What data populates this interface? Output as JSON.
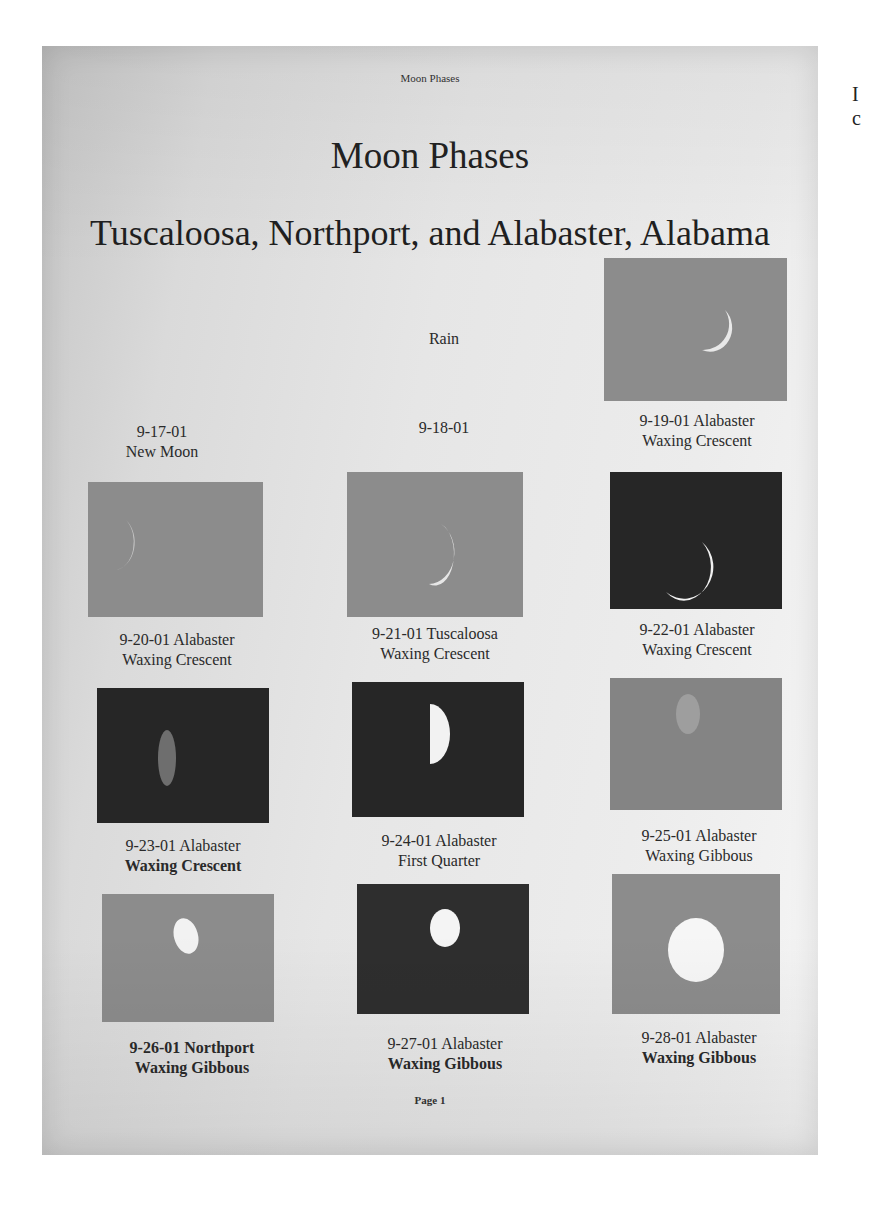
{
  "document": {
    "running_header": "Moon Phases",
    "title": "Moon Phases",
    "subtitle": "Tuscaloosa, Northport, and Alabaster, Alabama",
    "footer": "Page 1"
  },
  "right_edge_fragments": [
    "I",
    "c"
  ],
  "grid": [
    {
      "date": "9-17-01",
      "location": "",
      "phase": "New Moon",
      "photo": null,
      "note": ""
    },
    {
      "date": "9-18-01",
      "location": "",
      "phase": "",
      "photo": null,
      "note": "Rain"
    },
    {
      "date": "9-19-01",
      "location": "Alabaster",
      "phase": "Waxing Crescent",
      "photo": "thin-crescent-gray-sky",
      "note": ""
    },
    {
      "date": "9-20-01",
      "location": "Alabaster",
      "phase": "Waxing Crescent",
      "photo": "faint-crescent-gray-sky",
      "note": ""
    },
    {
      "date": "9-21-01",
      "location": "Tuscaloosa",
      "phase": "Waxing Crescent",
      "photo": "crescent-gray-sky",
      "note": ""
    },
    {
      "date": "9-22-01",
      "location": "Alabaster",
      "phase": "Waxing Crescent",
      "photo": "crescent-dark-sky",
      "note": ""
    },
    {
      "date": "9-23-01",
      "location": "Alabaster",
      "phase": "Waxing Crescent",
      "photo": "dim-crescent-dark-sky",
      "note": ""
    },
    {
      "date": "9-24-01",
      "location": "Alabaster",
      "phase": "First Quarter",
      "photo": "half-moon-dark-sky",
      "note": ""
    },
    {
      "date": "9-25-01",
      "location": "Alabaster",
      "phase": "Waxing Gibbous",
      "photo": "faint-gibbous-gray-sky",
      "note": ""
    },
    {
      "date": "9-26-01",
      "location": "Northport",
      "phase": "Waxing Gibbous",
      "photo": "gibbous-gray-sky",
      "note": ""
    },
    {
      "date": "9-27-01",
      "location": "Alabaster",
      "phase": "Waxing Gibbous",
      "photo": "gibbous-dark-sky",
      "note": ""
    },
    {
      "date": "9-28-01",
      "location": "Alabaster",
      "phase": "Waxing Gibbous",
      "photo": "large-gibbous-gray-sky",
      "note": ""
    }
  ],
  "captions": {
    "c0_line1": "9-17-01",
    "c0_line2": "New Moon",
    "c1_line1": "9-18-01",
    "c1_note": "Rain",
    "c2_line1": "9-19-01 Alabaster",
    "c2_line2": "Waxing Crescent",
    "c3_line1": "9-20-01 Alabaster",
    "c3_line2": "Waxing Crescent",
    "c4_line1": "9-21-01 Tuscaloosa",
    "c4_line2": "Waxing Crescent",
    "c5_line1": "9-22-01 Alabaster",
    "c5_line2": "Waxing Crescent",
    "c6_line1": "9-23-01 Alabaster",
    "c6_line2": "Waxing Crescent",
    "c7_line1": "9-24-01 Alabaster",
    "c7_line2": "First Quarter",
    "c8_line1": "9-25-01 Alabaster",
    "c8_line2": "Waxing Gibbous",
    "c9_line1": "9-26-01 Northport",
    "c9_line2": "Waxing Gibbous",
    "c10_line1": "9-27-01 Alabaster",
    "c10_line2": "Waxing Gibbous",
    "c11_line1": "9-28-01 Alabaster",
    "c11_line2": "Waxing Gibbous"
  }
}
